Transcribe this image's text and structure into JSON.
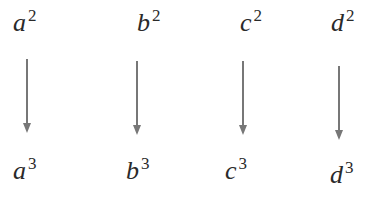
{
  "diagram": {
    "columns": [
      {
        "top": {
          "base": "a",
          "exp": "2"
        },
        "bottom": {
          "base": "a",
          "exp": "3"
        }
      },
      {
        "top": {
          "base": "b",
          "exp": "2"
        },
        "bottom": {
          "base": "b",
          "exp": "3"
        }
      },
      {
        "top": {
          "base": "c",
          "exp": "2"
        },
        "bottom": {
          "base": "c",
          "exp": "3"
        }
      },
      {
        "top": {
          "base": "d",
          "exp": "2"
        },
        "bottom": {
          "base": "d",
          "exp": "3"
        }
      }
    ],
    "arrow_color": "#777777",
    "text_color": "#2a2a2a"
  }
}
